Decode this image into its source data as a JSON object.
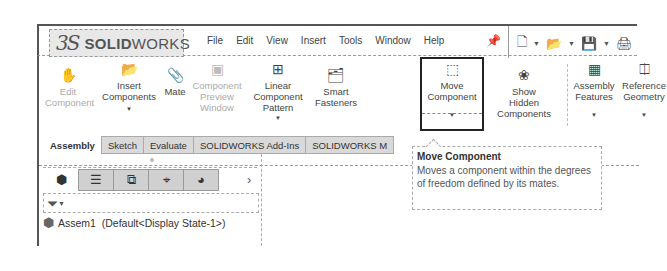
{
  "app": {
    "logo_ds": "3S",
    "logo_solid": "SOLID",
    "logo_works": "WORKS"
  },
  "menubar": {
    "items": [
      "File",
      "Edit",
      "View",
      "Insert",
      "Tools",
      "Window",
      "Help"
    ],
    "pin_icon": "pin-icon",
    "quick_access": [
      "new-document-icon",
      "open-folder-icon",
      "save-icon",
      "print-icon"
    ]
  },
  "ribbon": {
    "buttons": [
      {
        "id": "edit-component",
        "line1": "Edit",
        "line2": "Component",
        "line3": "",
        "icon": "edit-component-icon",
        "disabled": true,
        "dropdown": false
      },
      {
        "id": "insert-components",
        "line1": "Insert",
        "line2": "Components",
        "line3": "",
        "icon": "insert-components-icon",
        "disabled": false,
        "dropdown": true
      },
      {
        "id": "mate",
        "line1": "",
        "line2": "Mate",
        "line3": "",
        "icon": "mate-paperclip-icon",
        "disabled": false,
        "dropdown": false
      },
      {
        "id": "component-preview-window",
        "line1": "Component",
        "line2": "Preview",
        "line3": "Window",
        "icon": "preview-window-icon",
        "disabled": true,
        "dropdown": false
      },
      {
        "id": "linear-component-pattern",
        "line1": "Linear",
        "line2": "Component",
        "line3": "Pattern",
        "icon": "linear-pattern-icon",
        "disabled": false,
        "dropdown": true
      },
      {
        "id": "smart-fasteners",
        "line1": "Smart",
        "line2": "Fasteners",
        "line3": "",
        "icon": "smart-fasteners-icon",
        "disabled": false,
        "dropdown": false
      },
      {
        "id": "move-component",
        "line1": "Move",
        "line2": "Component",
        "line3": "",
        "icon": "move-component-icon",
        "disabled": false,
        "dropdown": true
      },
      {
        "id": "show-hidden-components",
        "line1": "Show",
        "line2": "Hidden",
        "line3": "Components",
        "icon": "show-hidden-icon",
        "disabled": false,
        "dropdown": false
      },
      {
        "id": "assembly-features",
        "line1": "Assembly",
        "line2": "Features",
        "line3": "",
        "icon": "assembly-features-icon",
        "disabled": false,
        "dropdown": true
      },
      {
        "id": "reference-geometry",
        "line1": "Reference",
        "line2": "Geometry",
        "line3": "",
        "icon": "reference-geometry-icon",
        "disabled": false,
        "dropdown": true
      }
    ]
  },
  "tabs": [
    {
      "label": "Assembly",
      "active": true
    },
    {
      "label": "Sketch",
      "active": false
    },
    {
      "label": "Evaluate",
      "active": false
    },
    {
      "label": "SOLIDWORKS Add-Ins",
      "active": false
    },
    {
      "label": "SOLIDWORKS M",
      "active": false
    }
  ],
  "panel": {
    "tabs": [
      "feature-manager-icon",
      "property-manager-icon",
      "configuration-manager-icon",
      "dimxpert-icon",
      "display-manager-icon"
    ],
    "more": "›",
    "filter_icon": "filter-icon",
    "tree_root": "Assem1  (Default<Display State-1>)"
  },
  "tooltip": {
    "title": "Move Component",
    "body": "Moves a component within the degrees of freedom defined by its mates."
  }
}
